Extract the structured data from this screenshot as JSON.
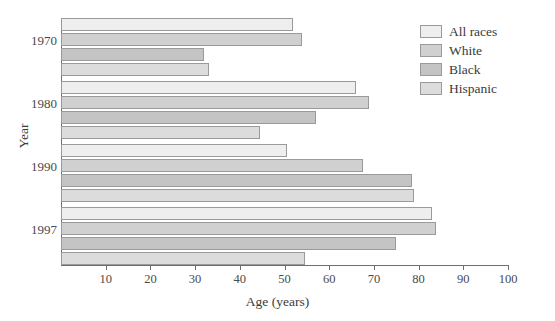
{
  "chart_data": {
    "type": "bar",
    "orientation": "horizontal",
    "title": "",
    "xlabel": "Age (years)",
    "ylabel": "Year",
    "categories": [
      "1970",
      "1980",
      "1990",
      "1997"
    ],
    "xlim": [
      0,
      100
    ],
    "xticks": [
      10,
      20,
      30,
      40,
      50,
      60,
      70,
      80,
      90,
      100
    ],
    "grid": false,
    "legend_position": "top-right",
    "series": [
      {
        "name": "All races",
        "color": "#eeeeee",
        "values": [
          52,
          66,
          50.5,
          83
        ]
      },
      {
        "name": "White",
        "color": "#d0d0d0",
        "values": [
          54,
          69,
          67.5,
          84
        ]
      },
      {
        "name": "Black",
        "color": "#c4c4c4",
        "values": [
          32,
          57,
          78.5,
          75
        ]
      },
      {
        "name": "Hispanic",
        "color": "#dcdcdc",
        "values": [
          33,
          44.5,
          79,
          54.5
        ]
      }
    ]
  },
  "axes": {
    "x_title": "Age (years)",
    "y_title": "Year",
    "x_tick_labels": [
      "10",
      "20",
      "30",
      "40",
      "50",
      "60",
      "70",
      "80",
      "90",
      "100"
    ],
    "y_tick_labels": [
      "1970",
      "1980",
      "1990",
      "1997"
    ]
  },
  "legend": {
    "items": [
      {
        "label": "All races"
      },
      {
        "label": "White"
      },
      {
        "label": "Black"
      },
      {
        "label": "Hispanic"
      }
    ]
  }
}
